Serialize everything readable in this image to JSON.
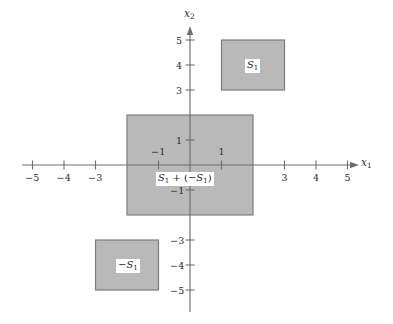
{
  "figure": {
    "kind": "cartesian-plane-diagram",
    "background_color": "#ffffff",
    "axis_color": "#6e6e72",
    "region_fill_color": "#b9b9b9",
    "region_stroke_color": "#7d7d7d"
  },
  "axes": {
    "x_axis": {
      "name": "x",
      "subscript": "1",
      "tick_labels": [
        "−5",
        "−4",
        "−3",
        "−1",
        "1",
        "3",
        "4",
        "5"
      ],
      "tick_values": [
        -5,
        -4,
        -3,
        -1,
        1,
        3,
        4,
        5
      ],
      "arrow": "right"
    },
    "y_axis": {
      "name": "x",
      "subscript": "2",
      "tick_labels": [
        "5",
        "4",
        "3",
        "1",
        "−1",
        "−3",
        "−4",
        "−5"
      ],
      "tick_values": [
        5,
        4,
        3,
        1,
        -1,
        -3,
        -4,
        -5
      ],
      "arrow": "up"
    }
  },
  "regions": [
    {
      "id": "S1",
      "label_main": "S",
      "label_sub": "1",
      "label_prefix": "",
      "x_range": [
        1,
        3
      ],
      "y_range": [
        3,
        5
      ],
      "label_at": [
        2,
        4
      ]
    },
    {
      "id": "sum",
      "label_main": "S",
      "label_sub": "1",
      "label_prefix": "",
      "label_full_parts": [
        "S",
        "1",
        " + (−S",
        "1",
        ")"
      ],
      "x_range": [
        -2,
        2
      ],
      "y_range": [
        -2,
        2
      ],
      "label_at": [
        0,
        -0.52
      ]
    },
    {
      "id": "negS1",
      "label_main": "S",
      "label_sub": "1",
      "label_prefix": "−",
      "x_range": [
        -3,
        -1
      ],
      "y_range": [
        -5,
        -3
      ],
      "label_at": [
        -2,
        -4
      ]
    }
  ],
  "labels": {
    "x_axis_name": "x",
    "x_axis_sub": "1",
    "y_axis_name": "x",
    "y_axis_sub": "2",
    "s1": "S",
    "s1_sub": "1",
    "neg_s1_prefix": "−",
    "neg_s1": "S",
    "neg_s1_sub": "1",
    "sum_part1": "S",
    "sum_sub1": "1",
    "sum_op": " + (−",
    "sum_part2": "S",
    "sum_sub2": "1",
    "sum_close": ")",
    "tick_m5": "−5",
    "tick_m4": "−4",
    "tick_m3": "−3",
    "tick_m1": "−1",
    "tick_p1": "1",
    "tick_p3": "3",
    "tick_p4": "4",
    "tick_p5": "5",
    "ytick_p5": "5",
    "ytick_p4": "4",
    "ytick_p3": "3",
    "ytick_p1": "1",
    "ytick_m1": "−1",
    "ytick_m3": "−3",
    "ytick_m4": "−4",
    "ytick_m5": "−5"
  }
}
